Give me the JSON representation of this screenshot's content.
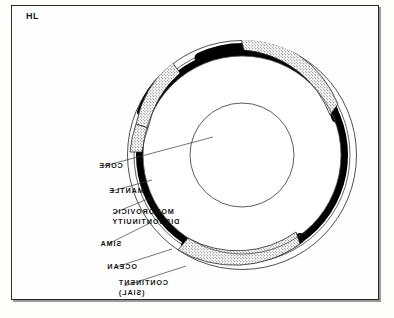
{
  "figure": {
    "corner_label": "HL",
    "orientation_note": "mirrored",
    "frame": {
      "x": 11,
      "y": 5,
      "width": 368,
      "height": 295
    },
    "colors": {
      "ink": "#161616",
      "crust_sima": "#000000",
      "continent_sial_fill": "#ffffff",
      "stipple_dot": "#3a3a3a",
      "background": "#fefefe",
      "outline": "#2a2a2a"
    }
  },
  "labels": [
    {
      "id": "core",
      "text": "CORE"
    },
    {
      "id": "mantle",
      "text": "MANTLE"
    },
    {
      "id": "moho_line1",
      "text": "MOHOROVICIC"
    },
    {
      "id": "moho_line2",
      "text": "DISCONTINUITY"
    },
    {
      "id": "sima",
      "text": "SIMA"
    },
    {
      "id": "ocean",
      "text": "OCEAN"
    },
    {
      "id": "cont_line1",
      "text": "CONTINENT"
    },
    {
      "id": "cont_line2",
      "text": "(SIAL)"
    }
  ],
  "diagram": {
    "center": {
      "cx": 242,
      "cy": 155
    },
    "radii": {
      "outer_surface": 115,
      "moho_outer": 108,
      "sima_outer": 106,
      "sima_inner": 99,
      "mantle_outer": 99,
      "core": 52
    },
    "layers": [
      {
        "name": "CORE",
        "kind": "circle",
        "radius": 52,
        "fill": "white",
        "stroke": "thin"
      },
      {
        "name": "MANTLE",
        "kind": "annulus",
        "outer": 99,
        "inner": 52,
        "fill": "white",
        "stroke": "thin"
      },
      {
        "name": "MOHOROVICIC DISCONTINUITY",
        "kind": "boundary",
        "radius": 106
      },
      {
        "name": "SIMA",
        "kind": "annulus",
        "outer": 106,
        "inner": 99,
        "fill": "black"
      },
      {
        "name": "CONTINENT (SIAL)",
        "kind": "patches",
        "fill": "stipple",
        "count": 4
      },
      {
        "name": "OCEAN",
        "kind": "surface",
        "radius": 115,
        "fill": "white",
        "stroke": "thin"
      }
    ],
    "continent_patches": [
      {
        "start_deg": 182,
        "end_deg": 226
      },
      {
        "start_deg": 252,
        "end_deg": 302
      },
      {
        "start_deg": 60,
        "end_deg": 122
      },
      {
        "start_deg": 148,
        "end_deg": 166
      }
    ],
    "leader_lines": [
      {
        "label": "core",
        "from": [
          104,
          166
        ],
        "to": [
          200,
          139
        ]
      },
      {
        "label": "mantle",
        "from": [
          114,
          191
        ],
        "to": [
          150,
          181
        ]
      },
      {
        "label": "moho",
        "from": [
          116,
          213
        ],
        "to": [
          150,
          199
        ]
      },
      {
        "label": "sima",
        "from": [
          110,
          244
        ],
        "to": [
          148,
          224
        ]
      },
      {
        "label": "ocean",
        "from": [
          118,
          267
        ],
        "to": [
          168,
          251
        ]
      },
      {
        "label": "continent",
        "from": [
          126,
          286
        ],
        "to": [
          180,
          268
        ]
      }
    ]
  }
}
